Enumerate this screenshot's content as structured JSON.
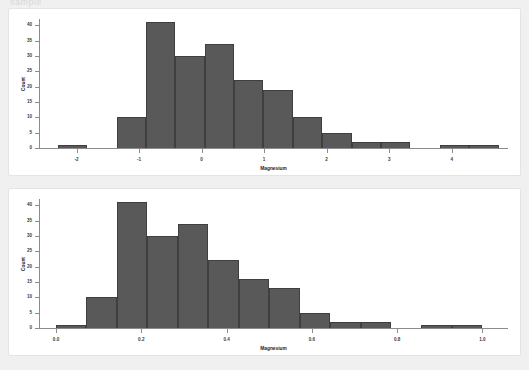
{
  "page": {
    "background_color": "#f0f0f0",
    "card_color": "#ffffff",
    "partial_top_text": "sample"
  },
  "chart_data": [
    {
      "id": "magnesium-standardized",
      "type": "bar",
      "title": "",
      "xlabel": "Magnesium",
      "ylabel": "Count",
      "xlim": [
        -2.6,
        4.9
      ],
      "ylim": [
        0,
        42
      ],
      "grid": false,
      "legend": null,
      "bar_color": "#595959",
      "bar_edge_color": "#3f3f3f",
      "xticks": [
        -2,
        -1,
        0,
        1,
        2,
        3,
        4
      ],
      "xtick_labels": [
        "-2",
        "-1",
        "0",
        "1",
        "2",
        "3",
        "4"
      ],
      "yticks": [
        0,
        5,
        10,
        15,
        20,
        25,
        30,
        35,
        40
      ],
      "ytick_labels": [
        "0",
        "5",
        "10",
        "15",
        "20",
        "25",
        "30",
        "35",
        "40"
      ],
      "bin_edges": [
        -2.3,
        -1.83,
        -1.36,
        -0.89,
        -0.42,
        0.05,
        0.52,
        0.99,
        1.46,
        1.93,
        2.4,
        2.87,
        3.34,
        3.81,
        4.28,
        4.75
      ],
      "values": [
        1,
        0,
        10,
        41,
        30,
        34,
        22,
        19,
        10,
        5,
        2,
        2,
        0,
        1,
        1
      ]
    },
    {
      "id": "magnesium-normalized",
      "type": "bar",
      "title": "",
      "xlabel": "Magnesium",
      "ylabel": "Count",
      "xlim": [
        -0.04,
        1.06
      ],
      "ylim": [
        0,
        42
      ],
      "grid": false,
      "legend": null,
      "bar_color": "#595959",
      "bar_edge_color": "#3f3f3f",
      "xticks": [
        0.0,
        0.2,
        0.4,
        0.6,
        0.8,
        1.0
      ],
      "xtick_labels": [
        "0.0",
        "0.2",
        "0.4",
        "0.6",
        "0.8",
        "1.0"
      ],
      "yticks": [
        0,
        5,
        10,
        15,
        20,
        25,
        30,
        35,
        40
      ],
      "ytick_labels": [
        "0",
        "5",
        "10",
        "15",
        "20",
        "25",
        "30",
        "35",
        "40"
      ],
      "bin_edges": [
        0.0,
        0.0714,
        0.1429,
        0.2143,
        0.2857,
        0.3571,
        0.4286,
        0.5,
        0.5714,
        0.6429,
        0.7143,
        0.7857,
        0.8571,
        0.9286,
        1.0
      ],
      "values": [
        1,
        10,
        41,
        30,
        34,
        22,
        16,
        13,
        5,
        2,
        2,
        0,
        1,
        1
      ]
    }
  ]
}
